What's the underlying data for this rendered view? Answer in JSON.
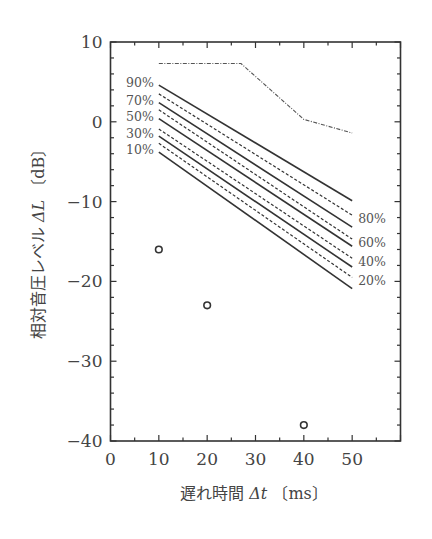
{
  "chart_data": {
    "type": "line",
    "title": "",
    "xlabel": "遅れ時間 Δt 〔ms〕",
    "ylabel": "相対音圧レベル ΔL 〔dB〕",
    "xlabel_parts": {
      "jp": "遅れ時間",
      "sym": "Δt",
      "unit": "〔ms〕"
    },
    "ylabel_parts": {
      "jp": "相対音圧レベル",
      "sym": "ΔL",
      "unit": "〔dB〕"
    },
    "xlim": [
      0,
      60
    ],
    "ylim": [
      -40,
      10
    ],
    "x_ticks": [
      0,
      10,
      20,
      30,
      40,
      50
    ],
    "x_tick_labels": [
      "0",
      "10",
      "20",
      "30",
      "40",
      "50"
    ],
    "x_minor_step": 5,
    "y_ticks": [
      10,
      0,
      -10,
      -20,
      -30,
      -40
    ],
    "y_tick_labels": [
      "10",
      "0",
      "−10",
      "−20",
      "−30",
      "−40"
    ],
    "y_minor_step": 2,
    "grid": false,
    "legend": "inline percentage labels at line ends",
    "series": [
      {
        "name": "90%",
        "style": "solid",
        "x": [
          10,
          50
        ],
        "y": [
          4.6,
          -9.9
        ],
        "label_side": "left"
      },
      {
        "name": "80%",
        "style": "dashed",
        "x": [
          10,
          50
        ],
        "y": [
          3.5,
          -11.7
        ],
        "label_side": "right"
      },
      {
        "name": "70%",
        "style": "solid",
        "x": [
          10,
          50
        ],
        "y": [
          2.4,
          -13.2
        ],
        "label_side": "left"
      },
      {
        "name": "60%",
        "style": "dashed",
        "x": [
          10,
          50
        ],
        "y": [
          1.5,
          -14.7
        ],
        "label_side": "right"
      },
      {
        "name": "50%",
        "style": "solid",
        "x": [
          10,
          50
        ],
        "y": [
          0.4,
          -15.6
        ],
        "label_side": "left"
      },
      {
        "name": "40%",
        "style": "dashed",
        "x": [
          10,
          50
        ],
        "y": [
          -0.9,
          -17.1
        ],
        "label_side": "right"
      },
      {
        "name": "30%",
        "style": "solid",
        "x": [
          10,
          50
        ],
        "y": [
          -1.8,
          -18.2
        ],
        "label_side": "left"
      },
      {
        "name": "20%",
        "style": "dashed",
        "x": [
          10,
          50
        ],
        "y": [
          -2.7,
          -19.5
        ],
        "label_side": "right"
      },
      {
        "name": "10%",
        "style": "solid",
        "x": [
          10,
          50
        ],
        "y": [
          -3.8,
          -20.9
        ],
        "label_side": "left"
      },
      {
        "name": "upper limit",
        "style": "dashdot",
        "x": [
          10,
          27,
          40,
          50
        ],
        "y": [
          7.3,
          7.3,
          0.3,
          -1.4
        ]
      },
      {
        "name": "measured",
        "style": "markers-open-circle",
        "x": [
          10,
          20,
          40
        ],
        "y": [
          -16,
          -23,
          -38
        ]
      }
    ]
  }
}
